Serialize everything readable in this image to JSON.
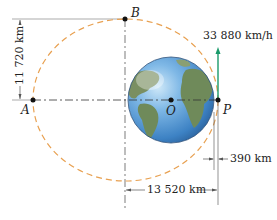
{
  "diagram": {
    "points": {
      "A": "A",
      "B": "B",
      "O": "O",
      "P": "P"
    },
    "dimensions": {
      "semi_minor": "11 720 km",
      "semi_major_offset": "13 520 km",
      "altitude_at_P": "390 km"
    },
    "velocity_label": "33 880 km/h",
    "colors": {
      "orbit": "#e8a050",
      "velocity_arrow": "#1a9a6a",
      "ocean": "#5a9fd4",
      "land": "#6f8a5a",
      "lines": "#555555"
    }
  }
}
